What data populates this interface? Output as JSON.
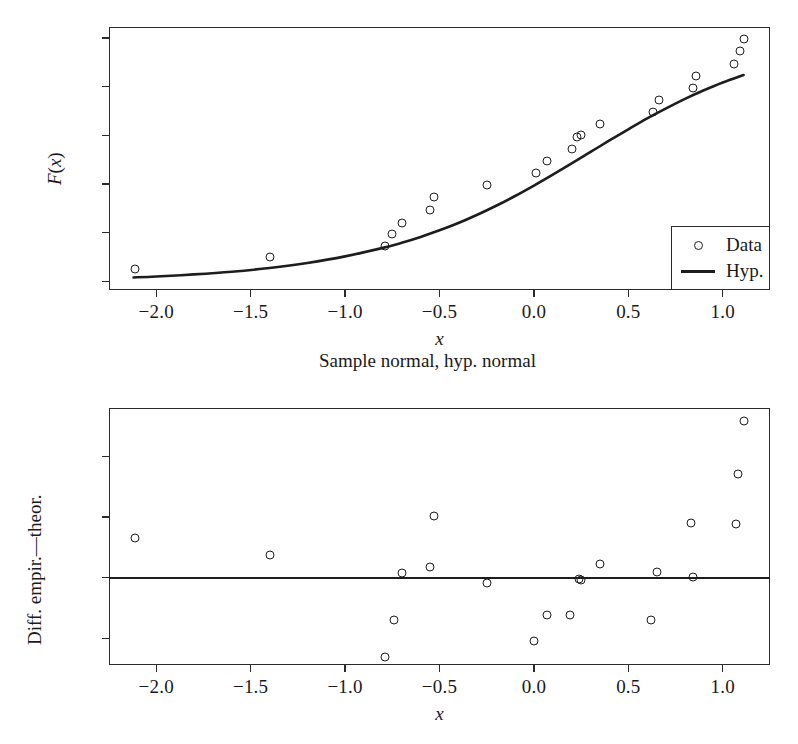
{
  "figure": {
    "caption": "Sample normal, hyp. normal"
  },
  "chart_data": [
    {
      "type": "scatter",
      "id": "cdf-panel",
      "title": "",
      "subtitle": "Sample normal, hyp. normal",
      "xlabel": "x",
      "ylabel": "F(x)",
      "xlim": [
        -2.25,
        1.25
      ],
      "ylim": [
        -0.035,
        1.045
      ],
      "xticks": [
        -2.0,
        -1.5,
        -1.0,
        -0.5,
        0.0,
        0.5,
        1.0
      ],
      "xticklabels": [
        "−2.0",
        "−1.5",
        "−1.0",
        "−0.5",
        "0.0",
        "0.5",
        "1.0"
      ],
      "yticks": [
        0.0,
        0.2,
        0.4,
        0.6,
        0.8,
        1.0
      ],
      "yticklabels": [
        "0.0",
        "0.2",
        "0.4",
        "0.6",
        "0.8",
        "1.0"
      ],
      "grid": false,
      "legend_position": "lower right",
      "series": [
        {
          "name": "Data",
          "marker": "open-circle",
          "type": "scatter",
          "points": [
            [
              -2.11,
              0.05
            ],
            [
              -1.4,
              0.1
            ],
            [
              -0.79,
              0.145
            ],
            [
              -0.75,
              0.195
            ],
            [
              -0.7,
              0.24
            ],
            [
              -0.55,
              0.295
            ],
            [
              -0.53,
              0.345
            ],
            [
              -0.25,
              0.395
            ],
            [
              0.01,
              0.445
            ],
            [
              0.07,
              0.495
            ],
            [
              0.2,
              0.545
            ],
            [
              0.23,
              0.595
            ],
            [
              0.25,
              0.6
            ],
            [
              0.35,
              0.645
            ],
            [
              0.63,
              0.695
            ],
            [
              0.66,
              0.745
            ],
            [
              0.84,
              0.795
            ],
            [
              0.86,
              0.845
            ],
            [
              1.06,
              0.895
            ],
            [
              1.09,
              0.945
            ],
            [
              1.11,
              0.995
            ]
          ]
        },
        {
          "name": "Hyp.",
          "type": "line",
          "description": "normal CDF hypothesis curve",
          "points": [
            [
              -2.12,
              0.0165
            ],
            [
              -2.0,
              0.0205
            ],
            [
              -1.8,
              0.029
            ],
            [
              -1.6,
              0.04
            ],
            [
              -1.4,
              0.0555
            ],
            [
              -1.2,
              0.076
            ],
            [
              -1.0,
              0.103
            ],
            [
              -0.8,
              0.138
            ],
            [
              -0.7,
              0.159
            ],
            [
              -0.6,
              0.183
            ],
            [
              -0.5,
              0.21
            ],
            [
              -0.4,
              0.24
            ],
            [
              -0.3,
              0.274
            ],
            [
              -0.2,
              0.311
            ],
            [
              -0.1,
              0.351
            ],
            [
              0.0,
              0.394
            ],
            [
              0.1,
              0.439
            ],
            [
              0.2,
              0.485
            ],
            [
              0.3,
              0.532
            ],
            [
              0.4,
              0.579
            ],
            [
              0.5,
              0.625
            ],
            [
              0.6,
              0.67
            ],
            [
              0.7,
              0.711
            ],
            [
              0.8,
              0.75
            ],
            [
              0.9,
              0.785
            ],
            [
              1.0,
              0.817
            ],
            [
              1.11,
              0.848
            ]
          ]
        }
      ]
    },
    {
      "type": "scatter",
      "id": "residual-panel",
      "title": "",
      "xlabel": "x",
      "ylabel": "Diff. empir.—theor.",
      "xlim": [
        -2.25,
        1.25
      ],
      "ylim": [
        -0.072,
        0.14
      ],
      "xticks": [
        -2.0,
        -1.5,
        -1.0,
        -0.5,
        0.0,
        0.5,
        1.0
      ],
      "xticklabels": [
        "−2.0",
        "−1.5",
        "−1.0",
        "−0.5",
        "0.0",
        "0.5",
        "1.0"
      ],
      "yticks": [
        -0.05,
        0.0,
        0.05,
        0.1
      ],
      "yticklabels": [
        "−0.05",
        "0.00",
        "0.05",
        "0.10"
      ],
      "grid": false,
      "reference_line": 0.0,
      "series": [
        {
          "name": "Diff. empir.—theor.",
          "marker": "open-circle",
          "type": "scatter",
          "points": [
            [
              -2.11,
              0.0325
            ],
            [
              -1.4,
              0.0185
            ],
            [
              -0.79,
              -0.065
            ],
            [
              -0.74,
              -0.0345
            ],
            [
              -0.7,
              0.004
            ],
            [
              -0.55,
              0.0085
            ],
            [
              -0.53,
              0.051
            ],
            [
              -0.25,
              -0.0045
            ],
            [
              0.0,
              -0.0525
            ],
            [
              0.07,
              -0.0305
            ],
            [
              0.19,
              -0.0305
            ],
            [
              0.24,
              -0.001
            ],
            [
              0.25,
              -0.0015
            ],
            [
              0.35,
              0.0115
            ],
            [
              0.62,
              -0.035
            ],
            [
              0.65,
              0.005
            ],
            [
              0.83,
              0.045
            ],
            [
              0.84,
              0.001
            ],
            [
              1.07,
              0.044
            ],
            [
              1.08,
              0.0855
            ],
            [
              1.11,
              0.1295
            ]
          ]
        }
      ]
    }
  ]
}
